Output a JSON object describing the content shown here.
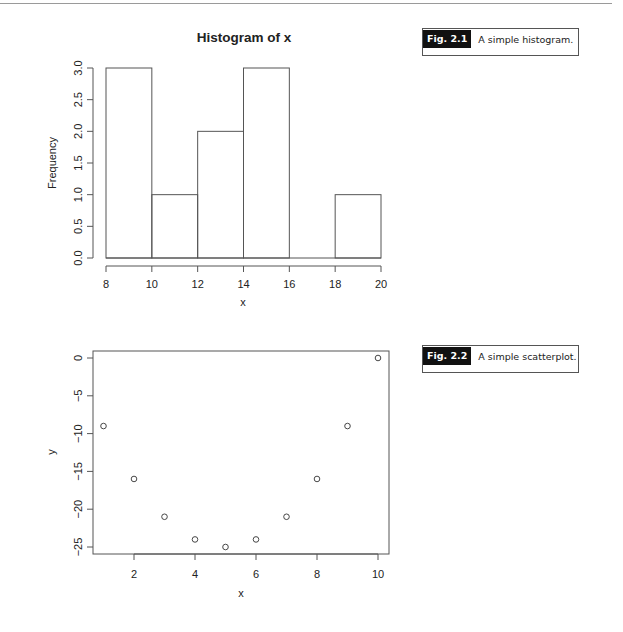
{
  "figures": [
    {
      "caption_tag": "Fig. 2.1",
      "caption_text": "A simple histogram."
    },
    {
      "caption_tag": "Fig. 2.2",
      "caption_text": "A simple scatterplot."
    }
  ],
  "chart_data": [
    {
      "type": "bar",
      "subtype": "histogram",
      "title": "Histogram of x",
      "xlabel": "x",
      "ylabel": "Frequency",
      "bins": [
        [
          8,
          10
        ],
        [
          10,
          12
        ],
        [
          12,
          14
        ],
        [
          14,
          16
        ],
        [
          16,
          18
        ],
        [
          18,
          20
        ]
      ],
      "categories": [
        "8-10",
        "10-12",
        "12-14",
        "14-16",
        "16-18",
        "18-20"
      ],
      "values": [
        3,
        1,
        2,
        3,
        0,
        1
      ],
      "xticks": [
        8,
        10,
        12,
        14,
        16,
        18,
        20
      ],
      "xtick_labels": [
        "8",
        "10",
        "12",
        "14",
        "16",
        "18",
        "20"
      ],
      "yticks": [
        0,
        0.5,
        1,
        1.5,
        2,
        2.5,
        3
      ],
      "ytick_labels": [
        "0.0",
        "0.5",
        "1.0",
        "1.5",
        "2.0",
        "2.5",
        "3.0"
      ],
      "xlim": [
        8,
        20
      ],
      "ylim": [
        0,
        3
      ],
      "grid": false,
      "legend": null
    },
    {
      "type": "scatter",
      "title": "",
      "xlabel": "x",
      "ylabel": "y",
      "x": [
        1,
        2,
        3,
        4,
        5,
        6,
        7,
        8,
        9,
        10
      ],
      "y": [
        -9,
        -16,
        -21,
        -24,
        -25,
        -24,
        -21,
        -16,
        -9,
        0
      ],
      "xticks": [
        2,
        4,
        6,
        8,
        10
      ],
      "xtick_labels": [
        "2",
        "4",
        "6",
        "8",
        "10"
      ],
      "yticks": [
        0,
        -5,
        -10,
        -15,
        -20,
        -25
      ],
      "ytick_labels": [
        "0",
        "−5",
        "−10",
        "−15",
        "−20",
        "−25"
      ],
      "xlim": [
        0.64,
        10.36
      ],
      "ylim": [
        -26,
        1
      ],
      "marker": "open-circle",
      "grid": false,
      "legend": null
    }
  ]
}
